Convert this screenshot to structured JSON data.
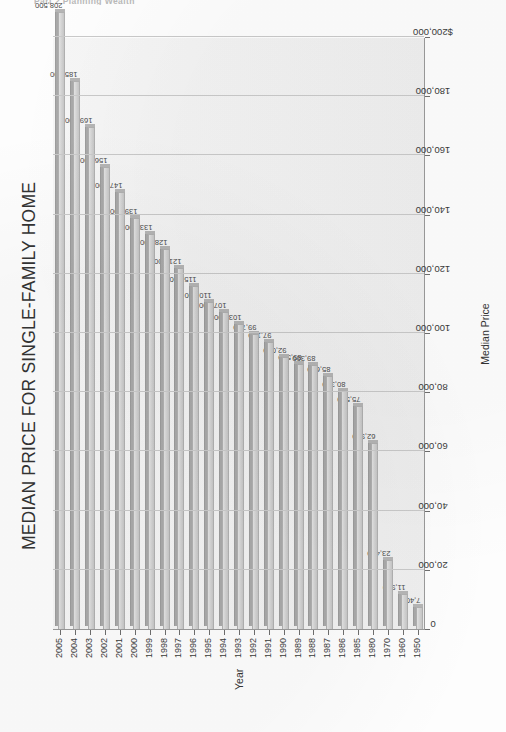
{
  "running_head": "Part 2  Planning Wealth",
  "chart_data": {
    "type": "bar",
    "orientation": "vertical-rotated",
    "title": "MEDIAN PRICE FOR SINGLE-FAMILY HOME",
    "xlabel": "Year",
    "ylabel": "Median Price",
    "ylim": [
      0,
      200000
    ],
    "grid": true,
    "legend": "none",
    "y_tick_labels": [
      "$200,000",
      "180,000",
      "160,000",
      "140,000",
      "120,000",
      "100,000",
      "80,000",
      "60,000",
      "40,000",
      "20,000",
      "0"
    ],
    "y_tick_values": [
      200000,
      180000,
      160000,
      140000,
      120000,
      100000,
      80000,
      60000,
      40000,
      20000,
      0
    ],
    "categories": [
      "1950",
      "1960",
      "1970",
      "1980",
      "1985",
      "1986",
      "1987",
      "1988",
      "1989",
      "1990",
      "1991",
      "1992",
      "1993",
      "1994",
      "1995",
      "1996",
      "1997",
      "1998",
      "1999",
      "2000",
      "2001",
      "2002",
      "2003",
      "2004",
      "2005"
    ],
    "values": [
      7400,
      11900,
      23400,
      62900,
      75500,
      80300,
      85600,
      89300,
      89500,
      92000,
      97100,
      99700,
      103100,
      107200,
      110500,
      115800,
      121800,
      128400,
      133300,
      139000,
      147800,
      156200,
      169500,
      185200,
      208500
    ],
    "data_labels": [
      "7,400",
      "11,900",
      "23,400",
      "62,900",
      "75,500",
      "80,300",
      "85,600",
      "89,300",
      "89,500",
      "92,000",
      "97,100",
      "99,700",
      "103,100",
      "107,200",
      "110,500",
      "115,800",
      "121,800",
      "128,400",
      "133,300",
      "139,000",
      "147,800",
      "156,200",
      "169,500",
      "185,200",
      "208,500"
    ],
    "colors": {
      "bar_face": "#d2d2d2",
      "bar_top": "#a9a9a9",
      "bar_border": "#b0b0b0",
      "plot_background": "#f1f1f1",
      "gridline": "#c9c9c9",
      "axis": "#9a9a9a",
      "text": "#3a3a3a"
    }
  }
}
